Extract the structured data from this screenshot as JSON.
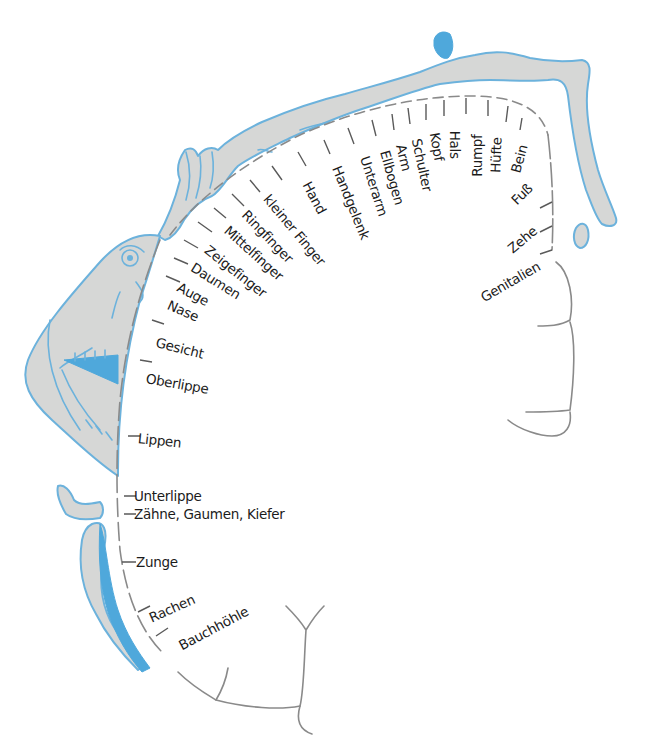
{
  "diagram": {
    "type": "sensory-homunculus",
    "colors": {
      "body_fill": "#d6d7d6",
      "body_outline": "#6cb2dc",
      "accent_blue": "#4fa8db",
      "cortex_line": "#8a8a8a",
      "text": "#1b1b1b"
    },
    "labels": [
      {
        "id": "genitalien",
        "text": "Genitalien"
      },
      {
        "id": "zehe",
        "text": "Zehe"
      },
      {
        "id": "fuss",
        "text": "Fuß"
      },
      {
        "id": "bein",
        "text": "Bein"
      },
      {
        "id": "huefte",
        "text": "Hüfte"
      },
      {
        "id": "rumpf",
        "text": "Rumpf"
      },
      {
        "id": "hals",
        "text": "Hals"
      },
      {
        "id": "kopf",
        "text": "Kopf"
      },
      {
        "id": "schulter",
        "text": "Schulter"
      },
      {
        "id": "arm",
        "text": "Arm"
      },
      {
        "id": "ellbogen",
        "text": "Ellbogen"
      },
      {
        "id": "unterarm",
        "text": "Unterarm"
      },
      {
        "id": "handgelenk",
        "text": "Handgelenk"
      },
      {
        "id": "hand",
        "text": "Hand"
      },
      {
        "id": "kleiner_finger",
        "text": "kleiner Finger"
      },
      {
        "id": "ringfinger",
        "text": "Ringfinger"
      },
      {
        "id": "mittelfinger",
        "text": "Mittelfinger"
      },
      {
        "id": "zeigefinger",
        "text": "Zeigefinger"
      },
      {
        "id": "daumen",
        "text": "Daumen"
      },
      {
        "id": "auge",
        "text": "Auge"
      },
      {
        "id": "nase",
        "text": "Nase"
      },
      {
        "id": "gesicht",
        "text": "Gesicht"
      },
      {
        "id": "oberlippe",
        "text": "Oberlippe"
      },
      {
        "id": "lippen",
        "text": "Lippen"
      },
      {
        "id": "unterlippe",
        "text": "Unterlippe"
      },
      {
        "id": "zaehne",
        "text": "Zähne, Gaumen, Kiefer"
      },
      {
        "id": "zunge",
        "text": "Zunge"
      },
      {
        "id": "rachen",
        "text": "Rachen"
      },
      {
        "id": "bauchhoehle",
        "text": "Bauchhöhle"
      }
    ]
  }
}
